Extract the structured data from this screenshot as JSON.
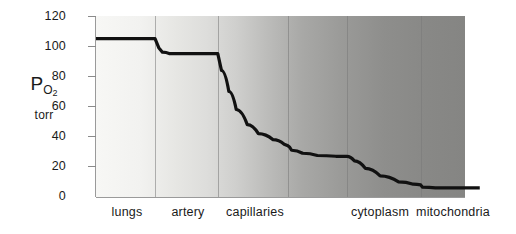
{
  "chart_data": {
    "type": "line",
    "title": "",
    "subtitle": "",
    "xlabel": "",
    "ylabel": "P O2",
    "yunit": "torr",
    "ylim": [
      0,
      120
    ],
    "yticks": [
      0,
      20,
      40,
      60,
      80,
      100,
      120
    ],
    "grid": false,
    "legend": false,
    "legend_position": "none",
    "categories": [
      "lungs",
      "artery",
      "capillaries",
      "cytoplasm",
      "mitochondria"
    ],
    "category_boundaries": [
      0,
      16,
      33,
      52,
      68,
      88,
      100
    ],
    "series": [
      {
        "name": "PO2 cascade",
        "color": "#111111",
        "points": [
          {
            "x": 0,
            "y": 105
          },
          {
            "x": 15,
            "y": 105
          },
          {
            "x": 16,
            "y": 105
          },
          {
            "x": 17,
            "y": 99
          },
          {
            "x": 18,
            "y": 96
          },
          {
            "x": 20,
            "y": 95
          },
          {
            "x": 32,
            "y": 95
          },
          {
            "x": 33,
            "y": 95
          },
          {
            "x": 34,
            "y": 84
          },
          {
            "x": 36,
            "y": 70
          },
          {
            "x": 38,
            "y": 58
          },
          {
            "x": 41,
            "y": 48
          },
          {
            "x": 44,
            "y": 42
          },
          {
            "x": 48,
            "y": 38
          },
          {
            "x": 51,
            "y": 35
          },
          {
            "x": 52,
            "y": 34
          },
          {
            "x": 52.5,
            "y": 33
          },
          {
            "x": 53,
            "y": 31
          },
          {
            "x": 56,
            "y": 29
          },
          {
            "x": 60,
            "y": 27.5
          },
          {
            "x": 65,
            "y": 27
          },
          {
            "x": 68,
            "y": 27
          },
          {
            "x": 70,
            "y": 24
          },
          {
            "x": 73,
            "y": 19
          },
          {
            "x": 77,
            "y": 14
          },
          {
            "x": 82,
            "y": 10
          },
          {
            "x": 86,
            "y": 8.5
          },
          {
            "x": 88,
            "y": 8
          },
          {
            "x": 88.5,
            "y": 6.5
          },
          {
            "x": 92,
            "y": 6
          },
          {
            "x": 100,
            "y": 6
          },
          {
            "x": 104,
            "y": 6
          }
        ]
      }
    ],
    "annotations": [
      {
        "label": "lungs plateau",
        "value": 105
      },
      {
        "label": "artery plateau",
        "value": 95
      },
      {
        "label": "capillaries step",
        "value": 33
      },
      {
        "label": "capillaries plateau",
        "value": 27
      },
      {
        "label": "mitochondria plateau",
        "value": 6
      }
    ]
  },
  "axis": {
    "symbol": "P",
    "subscript": "O",
    "subscript2": "2",
    "unit": "torr"
  },
  "ticks": {
    "t0": "0",
    "t20": "20",
    "t40": "40",
    "t60": "60",
    "t80": "80",
    "t100": "100",
    "t120": "120"
  },
  "categories": {
    "c0": "lungs",
    "c1": "artery",
    "c2": "capillaries",
    "c3": "cytoplasm",
    "c4": "mitochondria"
  }
}
